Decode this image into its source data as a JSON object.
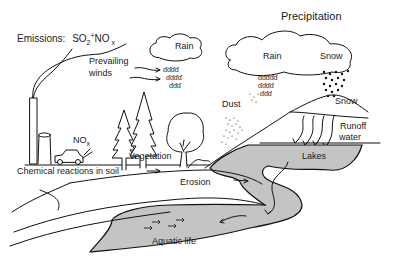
{
  "diagram": {
    "title": "Precipitation",
    "labels": {
      "emissions_prefix": "Emissions:",
      "so2": "SO",
      "so2_sub": "2",
      "plus": "+",
      "nox": "NO",
      "nox_sub": "x",
      "rain_left": "Rain",
      "prevailing_winds_line1": "Prevailing",
      "prevailing_winds_line2": "winds",
      "rain_right": "Rain",
      "snow_cloud": "Snow",
      "dust": "Dust",
      "snow_ground": "Snow",
      "runoff_line1": "Runoff",
      "runoff_line2": "water",
      "car_nox": "NO",
      "car_nox_sub": "x",
      "vegetation": "Vegetation",
      "lakes": "Lakes",
      "chemical_reactions": "Chemical reactions in soil",
      "erosion": "Erosion",
      "aquatic_life": "Aquatic life"
    },
    "elements": [
      "smokestack",
      "cooling-tower",
      "car",
      "trees",
      "deciduous-tree",
      "clouds",
      "rain-drops",
      "snow-flakes",
      "dust-particles",
      "mountain",
      "runoff-arrows",
      "lake",
      "river",
      "fish",
      "soil-layers"
    ],
    "colors": {
      "line": "#111111",
      "water": "#c4c4c4",
      "background": "#ffffff"
    }
  }
}
